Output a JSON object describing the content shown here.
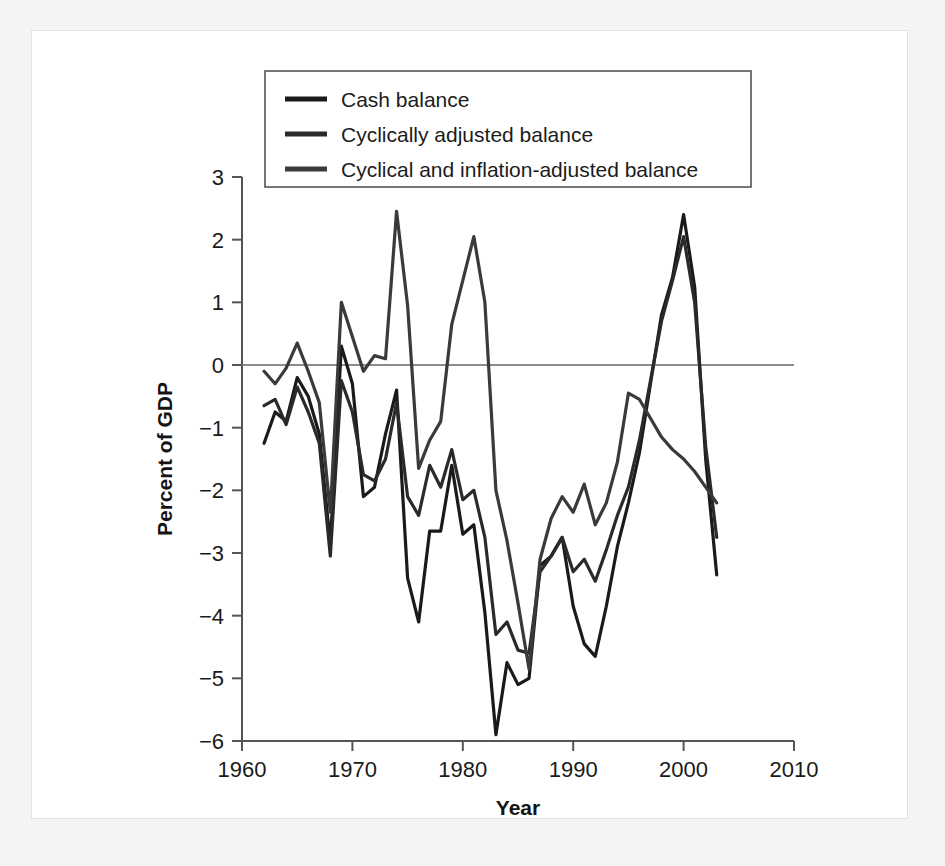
{
  "chart_data": {
    "type": "line",
    "title": "",
    "xlabel": "Year",
    "ylabel": "Percent of GDP",
    "xlim": [
      1960,
      2010
    ],
    "ylim": [
      -6,
      3
    ],
    "xticks": [
      1960,
      1970,
      1980,
      1990,
      2000,
      2010
    ],
    "xtick_labels": [
      "1960",
      "1970",
      "1980",
      "1990",
      "2000",
      "2010"
    ],
    "yticks": [
      -6,
      -5,
      -4,
      -3,
      -2,
      -1,
      0,
      1,
      2,
      3
    ],
    "ytick_labels": [
      "−6",
      "−5",
      "−4",
      "−3",
      "−2",
      "−1",
      "0",
      "1",
      "2",
      "3"
    ],
    "grid": false,
    "zero_line": true,
    "legend_position": "top-center",
    "x": [
      1962,
      1963,
      1964,
      1965,
      1966,
      1967,
      1968,
      1969,
      1970,
      1971,
      1972,
      1973,
      1974,
      1975,
      1976,
      1977,
      1978,
      1979,
      1980,
      1981,
      1982,
      1983,
      1984,
      1985,
      1986,
      1987,
      1988,
      1989,
      1990,
      1991,
      1992,
      1993,
      1994,
      1995,
      1996,
      1997,
      1998,
      1999,
      2000,
      2001,
      2002,
      2003
    ],
    "series": [
      {
        "name": "Cash balance",
        "color": "#1a1a1a",
        "values": [
          -1.25,
          -0.75,
          -0.9,
          -0.2,
          -0.5,
          -1.1,
          -2.85,
          0.3,
          -0.3,
          -2.1,
          -1.95,
          -1.1,
          -0.4,
          -3.4,
          -4.1,
          -2.65,
          -2.65,
          -1.6,
          -2.7,
          -2.55,
          -3.95,
          -5.9,
          -4.75,
          -5.1,
          -5.0,
          -3.2,
          -3.05,
          -2.75,
          -3.85,
          -4.45,
          -4.65,
          -3.85,
          -2.9,
          -2.2,
          -1.4,
          -0.3,
          0.8,
          1.4,
          2.4,
          1.25,
          -1.5,
          -3.35
        ]
      },
      {
        "name": "Cyclically adjusted balance",
        "color": "#2a2a2a",
        "values": [
          -0.65,
          -0.55,
          -0.95,
          -0.35,
          -0.75,
          -1.25,
          -3.05,
          -0.25,
          -0.75,
          -1.75,
          -1.85,
          -1.5,
          -0.6,
          -2.1,
          -2.4,
          -1.6,
          -1.95,
          -1.35,
          -2.15,
          -2.0,
          -2.75,
          -4.3,
          -4.1,
          -4.55,
          -4.6,
          -3.3,
          -3.05,
          -2.75,
          -3.3,
          -3.1,
          -3.45,
          -2.95,
          -2.4,
          -1.95,
          -1.2,
          -0.25,
          0.7,
          1.35,
          2.05,
          1.0,
          -1.3,
          -2.75
        ]
      },
      {
        "name": "Cyclical and inflation-adjusted balance",
        "color": "#3a3a3a",
        "values": [
          -0.1,
          -0.3,
          -0.05,
          0.35,
          -0.1,
          -0.6,
          -2.35,
          1.0,
          0.45,
          -0.1,
          0.15,
          0.1,
          2.45,
          0.95,
          -1.65,
          -1.2,
          -0.9,
          0.65,
          1.35,
          2.05,
          1.0,
          -2.0,
          -2.8,
          -3.8,
          -4.85,
          -3.1,
          -2.45,
          -2.1,
          -2.35,
          -1.9,
          -2.55,
          -2.2,
          -1.55,
          -0.45,
          -0.55,
          -0.85,
          -1.15,
          -1.35,
          -1.5,
          -1.7,
          -1.95,
          -2.2
        ]
      }
    ]
  },
  "chart": {
    "legend_items": [
      {
        "label": "Cash balance",
        "swatch": "legend-line-swatch"
      },
      {
        "label": "Cyclically adjusted balance",
        "swatch": "legend-line-swatch"
      },
      {
        "label": "Cyclical and inflation-adjusted balance",
        "swatch": "legend-line-swatch"
      }
    ]
  }
}
